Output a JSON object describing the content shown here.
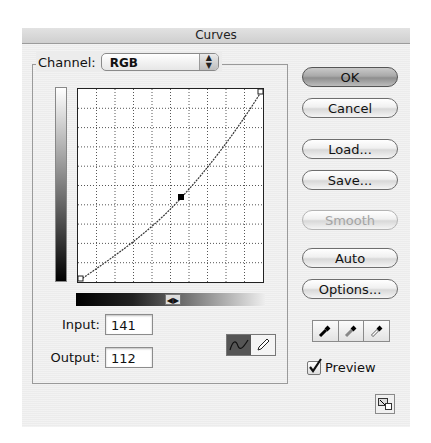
{
  "window": {
    "title": "Curves"
  },
  "channel": {
    "label": "Channel:",
    "value": "RGB"
  },
  "graph": {
    "grid_divisions": 10,
    "control_point": {
      "input": 141,
      "output": 112
    }
  },
  "fields": {
    "input_label": "Input:",
    "input_value": "141",
    "output_label": "Output:",
    "output_value": "112"
  },
  "tools": {
    "curve": "curve-tool",
    "pencil": "pencil-tool",
    "active": "curve"
  },
  "buttons": {
    "ok": "OK",
    "cancel": "Cancel",
    "load": "Load...",
    "save": "Save...",
    "smooth": "Smooth",
    "auto": "Auto",
    "options": "Options..."
  },
  "eyedroppers": [
    "black-point-eyedropper",
    "gray-point-eyedropper",
    "white-point-eyedropper"
  ],
  "preview": {
    "label": "Preview",
    "checked": true
  }
}
